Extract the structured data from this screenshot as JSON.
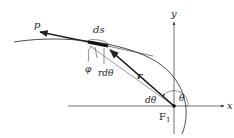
{
  "diagram": {
    "labels": {
      "p": "p",
      "ds": "ds",
      "phi": "φ",
      "r_dtheta": "rdθ",
      "r": "r",
      "dtheta": "dθ",
      "theta": "θ",
      "focus": "F",
      "focus_sub": "1",
      "x_axis": "x",
      "y_axis": "y"
    },
    "colors": {
      "line": "#222222",
      "axis": "#333333",
      "thin": "#555555"
    }
  }
}
